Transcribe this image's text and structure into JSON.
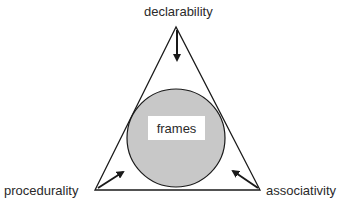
{
  "diagram": {
    "vertices": {
      "top": "declarability",
      "left": "procedurality",
      "right": "associativity"
    },
    "center": "frames",
    "colors": {
      "circle_fill": "#c8c8c8",
      "stroke": "#1a1a1a",
      "text": "#2a2a2a"
    }
  }
}
